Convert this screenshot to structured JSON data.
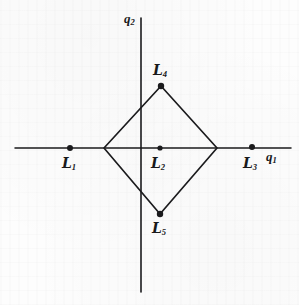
{
  "figure": {
    "kind": "coordinate-diagram",
    "background_color": "#fdfdfd",
    "ink_color": "#1b1b1d"
  },
  "axes": {
    "horizontal": {
      "label_text": "q",
      "label_sub": "1",
      "label_x": 266,
      "label_y": 156,
      "y": 148,
      "x_start": 15,
      "x_end": 291
    },
    "vertical": {
      "label_text": "q",
      "label_sub": "2",
      "label_x": 126,
      "label_y": 16,
      "x": 141,
      "y_start": 18,
      "y_end": 292
    }
  },
  "shape": {
    "type": "rhombus",
    "stroke_color": "#1b1b1d",
    "stroke_width": 1.7,
    "vertices": [
      {
        "name": "left",
        "x": 104,
        "y": 148
      },
      {
        "name": "top",
        "x": 161,
        "y": 86
      },
      {
        "name": "right",
        "x": 217,
        "y": 148
      },
      {
        "name": "bottom",
        "x": 160,
        "y": 214
      }
    ]
  },
  "points": [
    {
      "id": "L1",
      "label_text": "L",
      "label_sub": "1",
      "x": 70,
      "y": 148,
      "label_x": 62,
      "label_y": 155,
      "dot_radius": 3.0
    },
    {
      "id": "L2",
      "label_text": "L",
      "label_sub": "2",
      "x": 160,
      "y": 148,
      "label_x": 151,
      "label_y": 155,
      "dot_radius": 2.6
    },
    {
      "id": "L3",
      "label_text": "L",
      "label_sub": "3",
      "x": 252,
      "y": 147,
      "label_x": 243,
      "label_y": 155,
      "dot_radius": 3.0
    },
    {
      "id": "L4",
      "label_text": "L",
      "label_sub": "4",
      "x": 161,
      "y": 86,
      "label_x": 153,
      "label_y": 62,
      "dot_radius": 3.2
    },
    {
      "id": "L5",
      "label_text": "L",
      "label_sub": "5",
      "x": 160,
      "y": 214,
      "label_x": 152,
      "label_y": 220,
      "dot_radius": 3.2
    }
  ]
}
